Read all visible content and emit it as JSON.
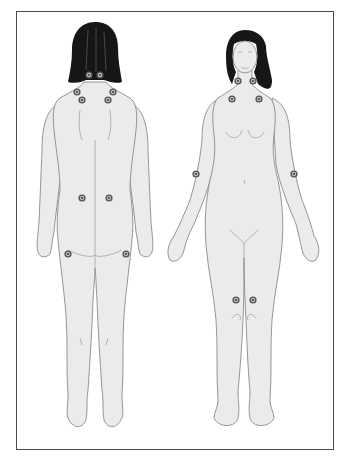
{
  "figure": {
    "views": [
      {
        "name": "back-view",
        "label": ""
      },
      {
        "name": "front-view",
        "label": ""
      }
    ],
    "colors": {
      "border": "#4a4a4a",
      "skin": "#ebebeb",
      "outline": "#8a8a8a",
      "hair": "#161616",
      "marker": "#555555",
      "background": "#ffffff"
    },
    "tender_points": {
      "back": [
        {
          "name": "occiput-left",
          "x": 89,
          "y": 75
        },
        {
          "name": "occiput-right",
          "x": 100,
          "y": 75
        },
        {
          "name": "trapezius-left",
          "x": 77,
          "y": 92
        },
        {
          "name": "trapezius-right",
          "x": 113,
          "y": 92
        },
        {
          "name": "supraspinatus-left",
          "x": 82,
          "y": 100
        },
        {
          "name": "supraspinatus-right",
          "x": 108,
          "y": 100
        },
        {
          "name": "gluteal-left",
          "x": 82,
          "y": 198
        },
        {
          "name": "gluteal-right",
          "x": 109,
          "y": 198
        },
        {
          "name": "trochanter-left",
          "x": 68,
          "y": 254
        },
        {
          "name": "trochanter-right",
          "x": 126,
          "y": 254
        }
      ],
      "front": [
        {
          "name": "low-cervical-left",
          "x": 238,
          "y": 81
        },
        {
          "name": "low-cervical-right",
          "x": 253,
          "y": 81
        },
        {
          "name": "second-rib-left",
          "x": 232,
          "y": 99
        },
        {
          "name": "second-rib-right",
          "x": 259,
          "y": 99
        },
        {
          "name": "lateral-epicondyle-left",
          "x": 196,
          "y": 174
        },
        {
          "name": "lateral-epicondyle-right",
          "x": 294,
          "y": 174
        },
        {
          "name": "knee-left",
          "x": 236,
          "y": 300
        },
        {
          "name": "knee-right",
          "x": 253,
          "y": 300
        }
      ]
    }
  }
}
